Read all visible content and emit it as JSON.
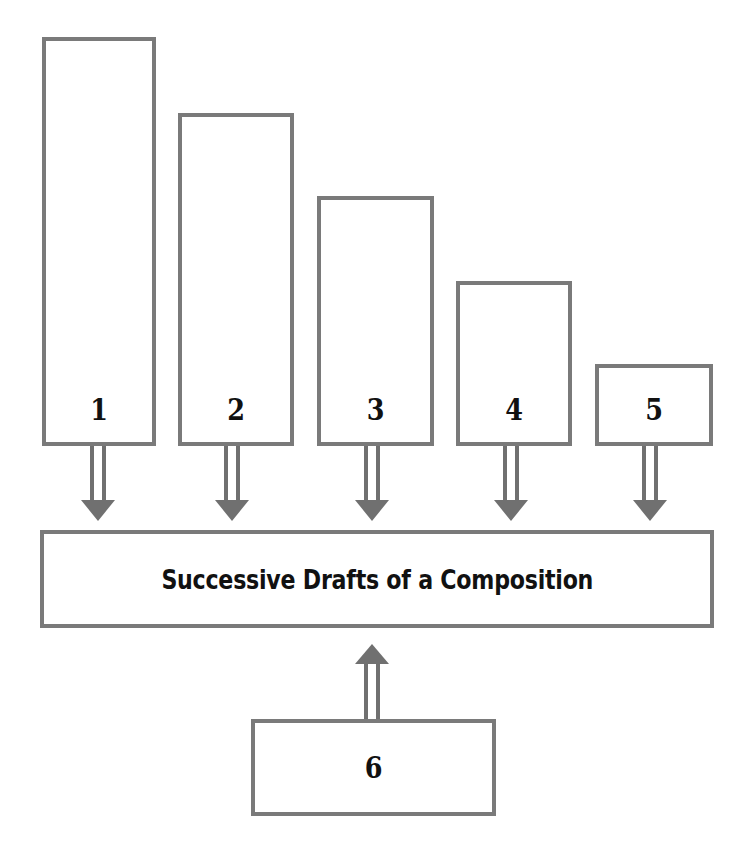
{
  "diagram": {
    "title": "Successive Drafts of a Composition",
    "colors": {
      "border": "#7a7a7a",
      "arrow": "#707070",
      "text": "#111111",
      "background": "#ffffff"
    },
    "top_boxes": [
      {
        "label": "1",
        "x": 42,
        "y": 37,
        "w": 114,
        "h": 409
      },
      {
        "label": "2",
        "x": 178,
        "y": 113,
        "w": 116,
        "h": 333
      },
      {
        "label": "3",
        "x": 317,
        "y": 196,
        "w": 117,
        "h": 250
      },
      {
        "label": "4",
        "x": 456,
        "y": 281,
        "w": 116,
        "h": 165
      },
      {
        "label": "5",
        "x": 595,
        "y": 364,
        "w": 118,
        "h": 82
      }
    ],
    "main_box": {
      "label": "Successive Drafts of a Composition",
      "x": 40,
      "y": 530,
      "w": 674,
      "h": 98
    },
    "bottom_box": {
      "label": "6",
      "x": 251,
      "y": 719,
      "w": 245,
      "h": 97
    },
    "arrows": [
      {
        "from": "1",
        "to": "main",
        "direction": "down"
      },
      {
        "from": "2",
        "to": "main",
        "direction": "down"
      },
      {
        "from": "3",
        "to": "main",
        "direction": "down"
      },
      {
        "from": "4",
        "to": "main",
        "direction": "down"
      },
      {
        "from": "5",
        "to": "main",
        "direction": "down"
      },
      {
        "from": "6",
        "to": "main",
        "direction": "up"
      }
    ]
  }
}
